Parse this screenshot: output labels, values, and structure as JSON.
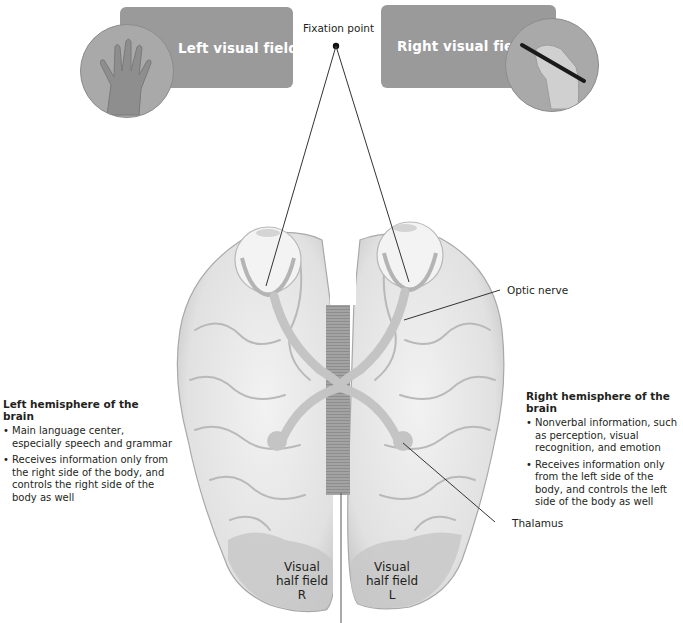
{
  "top": {
    "left_field": {
      "label": "Left visual field",
      "image": "hand-palm-icon",
      "box_color": "#9a9a9a"
    },
    "right_field": {
      "label": "Right visual field",
      "image": "hand-writing-pen-icon",
      "box_color": "#9a9a9a"
    },
    "fixation_point": {
      "label": "Fixation point"
    }
  },
  "callouts": {
    "optic_nerve": "Optic nerve",
    "thalamus": "Thalamus"
  },
  "left_hemisphere": {
    "title": "Left hemisphere of the brain",
    "bullets": [
      "Main language center, especially speech and grammar",
      "Receives information only from the right side of the body, and controls the right side of the body as well"
    ]
  },
  "right_hemisphere": {
    "title": "Right hemisphere of the brain",
    "bullets": [
      "Nonverbal information, such as perception, visual recognition, and emotion",
      "Receives information only from the left side of the body, and controls the left side of the body as well"
    ]
  },
  "visual_half_fields": {
    "left_lobe": {
      "line1": "Visual",
      "line2": "half field",
      "line3": "R"
    },
    "right_lobe": {
      "line1": "Visual",
      "line2": "half field",
      "line3": "L"
    }
  },
  "colors": {
    "brain_fill": "#e6e6e6",
    "brain_shadow": "#bdbdbd",
    "optic_pathway": "#c4c4c4",
    "corpus_callosum": "#9e9e9e",
    "label_box": "#9a9a9a",
    "text": "#231f20"
  }
}
